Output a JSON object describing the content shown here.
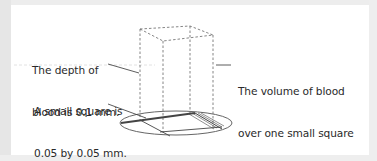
{
  "diagram": {
    "type": "haemocytometer-volume-illustration",
    "labels": {
      "depth": {
        "line1": "The depth of",
        "line2": "blood is 0.1 mm."
      },
      "square": {
        "line1": "A small square is",
        "line2": "0.05 by 0.05 mm."
      },
      "volume": {
        "line1": "The volume of blood",
        "line2": "over one small square",
        "line3_prefix": "is 0.00025 mm",
        "line3_sup": "3",
        "line3_suffix": "."
      }
    },
    "colors": {
      "background": "#ffffff",
      "text": "#2a2a2a",
      "lines": "#555555",
      "outer_border": "#ededed"
    },
    "values": {
      "depth_mm": 0.1,
      "square_side_mm": 0.05,
      "volume_mm3": 0.00025
    }
  }
}
